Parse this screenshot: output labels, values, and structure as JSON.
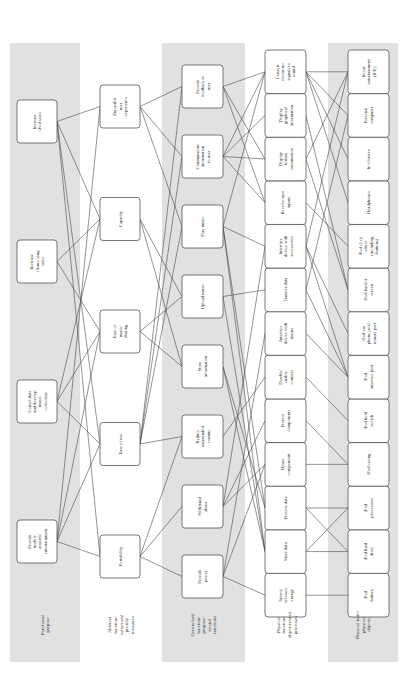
{
  "levels": [
    {
      "id": "fp",
      "label": [
        "Functional",
        "purpose"
      ],
      "shaded": true,
      "nodes": [
        {
          "id": "fp1",
          "lines": [
            "Provide",
            "mobile",
            "acoustic",
            "entertainment"
          ]
        },
        {
          "id": "fp2",
          "lines": [
            "Consolidate",
            "and develop",
            "music",
            "collection"
          ]
        },
        {
          "id": "fp3",
          "lines": [
            "Increase",
            "iTunes song",
            "sales"
          ]
        },
        {
          "id": "fp4",
          "lines": [
            "Increase",
            "iPod sales"
          ]
        }
      ]
    },
    {
      "id": "af",
      "label": [
        "Abstract",
        "function/",
        "values and",
        "priority",
        "measures"
      ],
      "shaded": false,
      "nodes": [
        {
          "id": "af1",
          "lines": [
            "Portability"
          ]
        },
        {
          "id": "af2",
          "lines": [
            "Ease of use"
          ]
        },
        {
          "id": "af3",
          "lines": [
            "Ease of",
            "music",
            "sharing"
          ]
        },
        {
          "id": "af4",
          "lines": [
            "Capacity"
          ]
        },
        {
          "id": "af5",
          "lines": [
            "Enjoyable",
            "user",
            "experience"
          ]
        }
      ]
    },
    {
      "id": "gf",
      "label": [
        "Generalised",
        "function/",
        "purpose-",
        "related",
        "functions"
      ],
      "shaded": true,
      "nodes": [
        {
          "id": "gf1",
          "lines": [
            "Provide",
            "power"
          ]
        },
        {
          "id": "gf2",
          "lines": [
            "Withstand",
            "abuse"
          ]
        },
        {
          "id": "gf3",
          "lines": [
            "Reduce",
            "unintended",
            "comms"
          ]
        },
        {
          "id": "gf4",
          "lines": [
            "Store",
            "information"
          ]
        },
        {
          "id": "gf5",
          "lines": [
            "Upload music"
          ]
        },
        {
          "id": "gf6",
          "lines": [
            "Play music"
          ]
        },
        {
          "id": "gf7",
          "lines": [
            "Communicate",
            "information",
            "to user"
          ]
        },
        {
          "id": "gf8",
          "lines": [
            "Provide",
            "feedback to",
            "user"
          ]
        }
      ]
    },
    {
      "id": "pfn",
      "label": [
        "Physical",
        "function/",
        "object-related",
        "processes"
      ],
      "shaded": false,
      "nodes": [
        {
          "id": "pfn1",
          "lines": [
            "Stores/",
            "releases",
            "energy"
          ]
        },
        {
          "id": "pfn2",
          "lines": [
            "Store data"
          ]
        },
        {
          "id": "pfn3",
          "lines": [
            "Process data"
          ]
        },
        {
          "id": "pfn4",
          "lines": [
            "House",
            "components"
          ]
        },
        {
          "id": "pfn5",
          "lines": [
            "Protect",
            "components"
          ]
        },
        {
          "id": "pfn6",
          "lines": [
            "Disable/",
            "enable",
            "controls"
          ]
        },
        {
          "id": "pfn7",
          "lines": [
            "Interface",
            "device with",
            "mains"
          ]
        },
        {
          "id": "pfn8",
          "lines": [
            "Transfer data"
          ]
        },
        {
          "id": "pfn9",
          "lines": [
            "Interface",
            "device with",
            "accessories"
          ]
        },
        {
          "id": "pfn10",
          "lines": [
            "Receive user",
            "inputs"
          ]
        },
        {
          "id": "pfn11",
          "lines": [
            "Display",
            "textual",
            "information"
          ]
        },
        {
          "id": "pfn12",
          "lines": [
            "Display",
            "graphical",
            "information"
          ]
        },
        {
          "id": "pfn13",
          "lines": [
            "Convert",
            "electronic",
            "signals to",
            "sound"
          ]
        }
      ]
    },
    {
      "id": "pfo",
      "label": [
        "Physical form/",
        "physical",
        "objects"
      ],
      "shaded": true,
      "nodes": [
        {
          "id": "pfo1",
          "lines": [
            "iPod",
            "battery"
          ]
        },
        {
          "id": "pfo2",
          "lines": [
            "iPod hard",
            "drive"
          ]
        },
        {
          "id": "pfo3",
          "lines": [
            "iPod",
            "processors"
          ]
        },
        {
          "id": "pfo4",
          "lines": [
            "iPod casing"
          ]
        },
        {
          "id": "pfo5",
          "lines": [
            "iPod hold",
            "switch"
          ]
        },
        {
          "id": "pfo6",
          "lines": [
            "iPod",
            "interface port"
          ]
        },
        {
          "id": "pfo7",
          "lines": [
            "iPod ear",
            "phone jack/",
            "remote port"
          ]
        },
        {
          "id": "pfo8",
          "lines": [
            "iPod backlit",
            "screen"
          ]
        },
        {
          "id": "pfo9",
          "lines": [
            "iPod click",
            "wheel",
            "(including",
            "buttons)"
          ]
        },
        {
          "id": "pfo10",
          "lines": [
            "Headphones"
          ]
        },
        {
          "id": "pfo11",
          "lines": [
            "hi-fi/stereo"
          ]
        },
        {
          "id": "pfo12",
          "lines": [
            "Personal",
            "computer"
          ]
        },
        {
          "id": "pfo13",
          "lines": [
            "In-car",
            "entertainment",
            "(ICE)"
          ]
        }
      ]
    }
  ],
  "edges": [
    [
      "fp1",
      "af1"
    ],
    [
      "fp1",
      "af2"
    ],
    [
      "fp1",
      "af3"
    ],
    [
      "fp1",
      "af5"
    ],
    [
      "fp2",
      "af2"
    ],
    [
      "fp2",
      "af3"
    ],
    [
      "fp2",
      "af4"
    ],
    [
      "fp3",
      "af3"
    ],
    [
      "fp3",
      "af4"
    ],
    [
      "fp4",
      "af1"
    ],
    [
      "fp4",
      "af2"
    ],
    [
      "fp4",
      "af4"
    ],
    [
      "fp4",
      "af5"
    ],
    [
      "af1",
      "gf1"
    ],
    [
      "af1",
      "gf2"
    ],
    [
      "af1",
      "gf3"
    ],
    [
      "af2",
      "gf3"
    ],
    [
      "af2",
      "gf6"
    ],
    [
      "af2",
      "gf7"
    ],
    [
      "af2",
      "gf8"
    ],
    [
      "af3",
      "gf4"
    ],
    [
      "af3",
      "gf5"
    ],
    [
      "af4",
      "gf4"
    ],
    [
      "af4",
      "gf5"
    ],
    [
      "af5",
      "gf6"
    ],
    [
      "af5",
      "gf7"
    ],
    [
      "af5",
      "gf8"
    ],
    [
      "gf1",
      "pfn1"
    ],
    [
      "gf1",
      "pfn7"
    ],
    [
      "gf1",
      "pfn4"
    ],
    [
      "gf2",
      "pfn4"
    ],
    [
      "gf2",
      "pfn5"
    ],
    [
      "gf2",
      "pfn9"
    ],
    [
      "gf3",
      "pfn6"
    ],
    [
      "gf4",
      "pfn2"
    ],
    [
      "gf4",
      "pfn3"
    ],
    [
      "gf5",
      "pfn8"
    ],
    [
      "gf5",
      "pfn2"
    ],
    [
      "gf6",
      "pfn13"
    ],
    [
      "gf6",
      "pfn3"
    ],
    [
      "gf6",
      "pfn2"
    ],
    [
      "gf6",
      "pfn9"
    ],
    [
      "gf7",
      "pfn11"
    ],
    [
      "gf7",
      "pfn12"
    ],
    [
      "gf7",
      "pfn13"
    ],
    [
      "gf7",
      "pfn10"
    ],
    [
      "gf8",
      "pfn13"
    ],
    [
      "gf8",
      "pfn11"
    ],
    [
      "gf8",
      "pfn10"
    ],
    [
      "pfn1",
      "pfo1"
    ],
    [
      "pfn2",
      "pfo2"
    ],
    [
      "pfn2",
      "pfo3"
    ],
    [
      "pfn3",
      "pfo3"
    ],
    [
      "pfn3",
      "pfo2"
    ],
    [
      "pfn4",
      "pfo4"
    ],
    [
      "pfn5",
      "pfo4"
    ],
    [
      "pfn6",
      "pfo5"
    ],
    [
      "pfn7",
      "pfo6"
    ],
    [
      "pfn8",
      "pfo6"
    ],
    [
      "pfn9",
      "pfo6"
    ],
    [
      "pfn9",
      "pfo7"
    ],
    [
      "pfn10",
      "pfo9"
    ],
    [
      "pfn11",
      "pfo8"
    ],
    [
      "pfn12",
      "pfo8"
    ],
    [
      "pfn13",
      "pfo10"
    ],
    [
      "pfn13",
      "pfo11"
    ],
    [
      "pfn13",
      "pfo12"
    ],
    [
      "pfn13",
      "pfo13"
    ],
    [
      "pfn8",
      "pfo12"
    ],
    [
      "pfn9",
      "pfo13"
    ],
    [
      "pfn11",
      "pfo13"
    ]
  ]
}
